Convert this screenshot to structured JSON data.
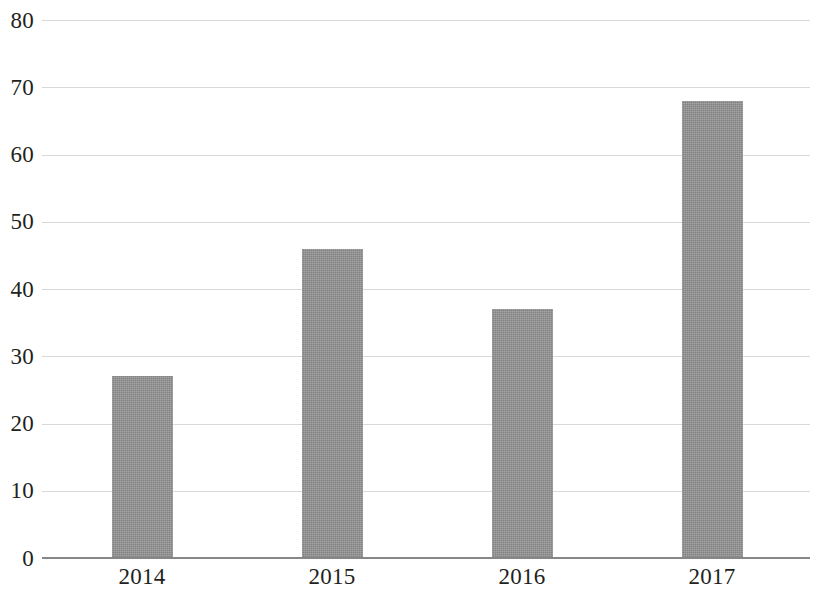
{
  "chart_data": {
    "type": "bar",
    "title": "",
    "subtitle": "",
    "xlabel": "",
    "ylabel": "",
    "categories": [
      "2014",
      "2015",
      "2016",
      "2017"
    ],
    "values": [
      27,
      46,
      37,
      68
    ],
    "series": [
      {
        "name": "",
        "values": [
          27,
          46,
          37,
          68
        ]
      }
    ],
    "ylim": [
      0,
      80
    ],
    "yticks": [
      0,
      10,
      20,
      30,
      40,
      50,
      60,
      70,
      80
    ],
    "ytick_labels": [
      "0",
      "10",
      "20",
      "30",
      "40",
      "50",
      "60",
      "70",
      "80"
    ],
    "xtick_labels": [
      "2014",
      "2015",
      "2016",
      "2017"
    ],
    "grid": true,
    "grid_axis": "y",
    "legend": false,
    "legend_position": "none",
    "annotations": [],
    "colors": {
      "bar_fill": "#8c8c8c",
      "gridline": "#d9d9d9",
      "axis_line": "#878787",
      "text": "#231f20",
      "background": "#ffffff"
    }
  }
}
